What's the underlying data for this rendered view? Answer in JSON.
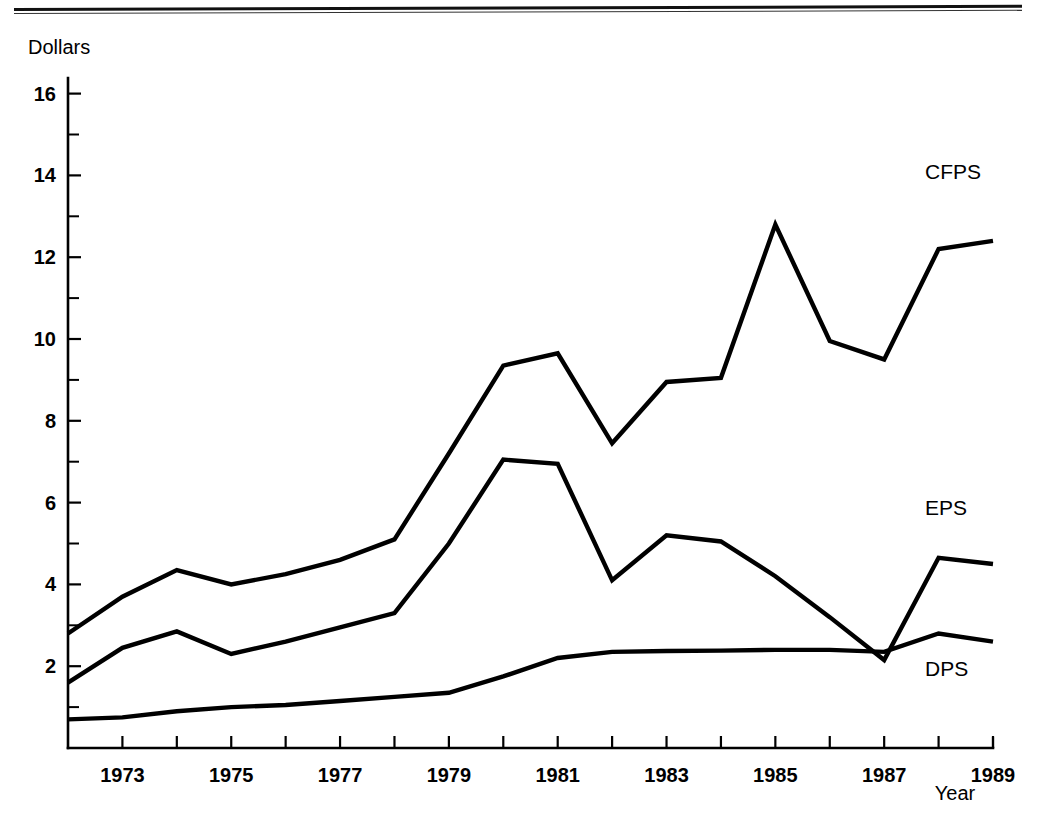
{
  "page": {
    "has_top_rule": true,
    "background_color": "#ffffff",
    "ink_color": "#000000"
  },
  "chart_data": {
    "type": "line",
    "title": "",
    "subtitle": "",
    "xlabel": "Year",
    "ylabel": "Dollars",
    "xlim": [
      1972,
      1989
    ],
    "ylim": [
      0,
      16.8
    ],
    "grid": false,
    "legend_position": "right-inline-labels",
    "y_ticks_major": [
      2,
      4,
      6,
      8,
      10,
      12,
      14,
      16
    ],
    "y_ticks_minor": [
      1,
      3,
      5,
      7,
      9,
      11,
      13,
      15
    ],
    "y_tick_labels": [
      "2",
      "4",
      "6",
      "8",
      "10",
      "12",
      "14",
      "16"
    ],
    "x_ticks_all": [
      1972,
      1973,
      1974,
      1975,
      1976,
      1977,
      1978,
      1979,
      1980,
      1981,
      1982,
      1983,
      1984,
      1985,
      1986,
      1987,
      1988,
      1989
    ],
    "x_tick_labels_shown": [
      "1973",
      "1975",
      "1977",
      "1979",
      "1981",
      "1983",
      "1985",
      "1987",
      "1989"
    ],
    "x_labeled_years": [
      1973,
      1975,
      1977,
      1979,
      1981,
      1983,
      1985,
      1987,
      1989
    ],
    "x": [
      1972,
      1973,
      1974,
      1975,
      1976,
      1977,
      1978,
      1979,
      1980,
      1981,
      1982,
      1983,
      1984,
      1985,
      1986,
      1987,
      1988,
      1989
    ],
    "series": [
      {
        "name": "CFPS",
        "label": "CFPS",
        "label_year": 1989,
        "label_value": 13.9,
        "values": [
          2.8,
          3.7,
          4.35,
          4.0,
          4.25,
          4.6,
          5.1,
          7.2,
          9.35,
          9.65,
          7.45,
          8.95,
          9.05,
          12.8,
          9.95,
          9.5,
          12.2,
          12.4
        ]
      },
      {
        "name": "EPS",
        "label": "EPS",
        "label_year": 1989,
        "label_value": 5.7,
        "values": [
          1.6,
          2.45,
          2.85,
          2.3,
          2.6,
          2.95,
          3.3,
          5.0,
          7.05,
          6.95,
          4.1,
          5.2,
          5.05,
          4.2,
          3.2,
          2.15,
          4.65,
          4.5
        ]
      },
      {
        "name": "DPS",
        "label": "DPS",
        "label_year": 1989,
        "label_value": 1.75,
        "values": [
          0.7,
          0.75,
          0.9,
          1.0,
          1.05,
          1.15,
          1.25,
          1.35,
          1.75,
          2.2,
          2.35,
          2.37,
          2.38,
          2.4,
          2.4,
          2.35,
          2.8,
          2.6
        ]
      }
    ]
  }
}
